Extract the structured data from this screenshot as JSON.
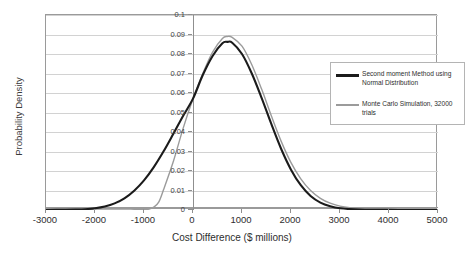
{
  "chart_data": {
    "type": "line",
    "title": "",
    "xlabel": "Cost Difference ($ millions)",
    "ylabel": "Probability Density",
    "xlim": [
      -3000,
      5000
    ],
    "ylim": [
      0,
      0.1
    ],
    "xticks": [
      "-3000",
      "-2000",
      "-1000",
      "0",
      "1000",
      "2000",
      "3000",
      "4000",
      "5000"
    ],
    "xtick_values": [
      -3000,
      -2000,
      -1000,
      0,
      1000,
      2000,
      3000,
      4000,
      5000
    ],
    "yticks": [
      "0",
      "0.01",
      "0.02",
      "0.03",
      "0.04",
      "0.05",
      "0.06",
      "0.07",
      "0.08",
      "0.09",
      "0.1"
    ],
    "ytick_values": [
      0,
      0.01,
      0.02,
      0.03,
      0.04,
      0.05,
      0.06,
      0.07,
      0.08,
      0.09,
      0.1
    ],
    "grid": "horizontal",
    "legend_position": "upper-right-inside",
    "value_axis_crosses_at": 0,
    "series": [
      {
        "name": "Second moment Method using Normal Distribution",
        "color": "#1b1b1b",
        "width": 2.1,
        "x": [
          -3000,
          -2600,
          -2400,
          -2200,
          -2000,
          -1800,
          -1600,
          -1400,
          -1200,
          -1000,
          -800,
          -600,
          -400,
          -200,
          0,
          200,
          400,
          600,
          700,
          800,
          1000,
          1200,
          1400,
          1600,
          1800,
          2000,
          2200,
          2400,
          2600,
          2800,
          3000,
          3400,
          3800,
          4200,
          5000
        ],
        "y": [
          0.0,
          0.0001,
          0.0002,
          0.0004,
          0.0009,
          0.0018,
          0.0034,
          0.006,
          0.0099,
          0.0152,
          0.022,
          0.0301,
          0.0391,
          0.0483,
          0.0571,
          0.0692,
          0.079,
          0.0855,
          0.0862,
          0.0858,
          0.08,
          0.07,
          0.0575,
          0.044,
          0.0313,
          0.0207,
          0.0127,
          0.0072,
          0.0038,
          0.0019,
          0.0009,
          0.0002,
          0.0001,
          0.0,
          0.0
        ]
      },
      {
        "name": "Monte Carlo Simulation, 32000 trials",
        "color": "#9b9b9b",
        "width": 1.4,
        "x": [
          -3000,
          -1600,
          -1400,
          -1200,
          -1000,
          -900,
          -800,
          -700,
          -600,
          -400,
          -200,
          0,
          200,
          400,
          600,
          700,
          800,
          1000,
          1200,
          1400,
          1600,
          1800,
          2000,
          2200,
          2400,
          2600,
          2800,
          3000,
          3200,
          3600,
          4000,
          4400,
          5000
        ],
        "y": [
          0.0,
          0.0,
          0.0,
          0.0001,
          0.0002,
          0.0005,
          0.0015,
          0.004,
          0.0105,
          0.025,
          0.042,
          0.057,
          0.07,
          0.081,
          0.088,
          0.089,
          0.0885,
          0.084,
          0.0745,
          0.062,
          0.0482,
          0.0352,
          0.0243,
          0.016,
          0.01,
          0.006,
          0.0035,
          0.002,
          0.0012,
          0.0004,
          0.0001,
          0.0,
          0.0
        ]
      }
    ]
  }
}
